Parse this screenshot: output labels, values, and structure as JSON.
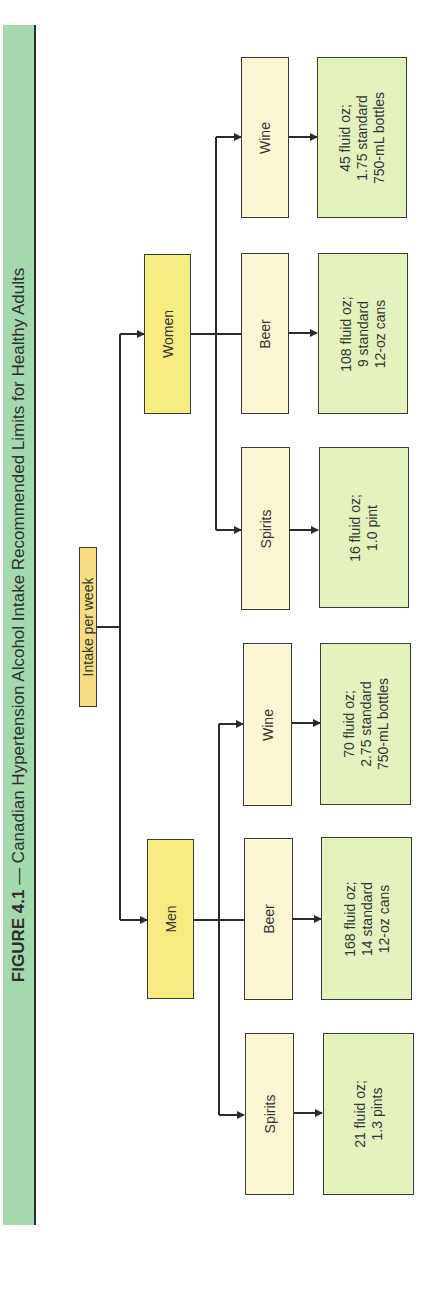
{
  "title": {
    "figure_label": "FIGURE 4.1",
    "separator": " — ",
    "caption": "Canadian Hypertension Alcohol Intake Recommended Limits for Healthy Adults"
  },
  "root": {
    "label": "Intake per week"
  },
  "groups": [
    {
      "label": "Women",
      "drinks": [
        {
          "label": "Wine",
          "amount": [
            "45 fluid oz;",
            "1.75 standard",
            "750-mL bottles"
          ]
        },
        {
          "label": "Beer",
          "amount": [
            "108 fluid oz;",
            "9 standard",
            "12-oz cans"
          ]
        },
        {
          "label": "Spirits",
          "amount": [
            "16 fluid oz;",
            "1.0 pint"
          ]
        }
      ]
    },
    {
      "label": "Men",
      "drinks": [
        {
          "label": "Wine",
          "amount": [
            "70 fluid oz;",
            "2.75 standard",
            "750-mL bottles"
          ]
        },
        {
          "label": "Beer",
          "amount": [
            "168 fluid oz;",
            "14 standard",
            "12-oz cans"
          ]
        },
        {
          "label": "Spirits",
          "amount": [
            "21 fluid oz;",
            "1.3 pints"
          ]
        }
      ]
    }
  ],
  "colors": {
    "banner": "#a3d9ad",
    "root_box": "#f7dc82",
    "gender_box": "#f6ec82",
    "drink_box": "#fbf7d2",
    "amount_box": "#e4f3be",
    "lines": "#2b2b2b"
  }
}
